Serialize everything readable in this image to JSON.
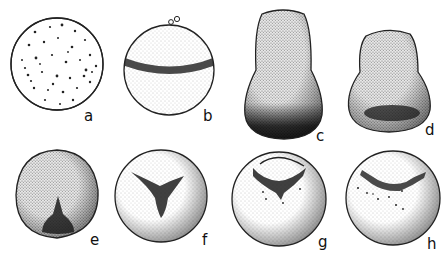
{
  "figure": {
    "type": "embryo-development-stages",
    "panels": [
      {
        "id": "a",
        "label": "a",
        "shape": "sphere-speckled"
      },
      {
        "id": "b",
        "label": "b",
        "shape": "sphere-band"
      },
      {
        "id": "c",
        "label": "c",
        "shape": "pear-dark-base"
      },
      {
        "id": "d",
        "label": "d",
        "shape": "pear-dark-band"
      },
      {
        "id": "e",
        "label": "e",
        "shape": "rounded-dark-notch"
      },
      {
        "id": "f",
        "label": "f",
        "shape": "sphere-triradiate"
      },
      {
        "id": "g",
        "label": "g",
        "shape": "sphere-cap-band"
      },
      {
        "id": "h",
        "label": "h",
        "shape": "sphere-dotted-band"
      }
    ],
    "colors": {
      "ink": "#1a1a1a",
      "paper": "#ffffff",
      "stipple": "#9a9a9a"
    }
  }
}
